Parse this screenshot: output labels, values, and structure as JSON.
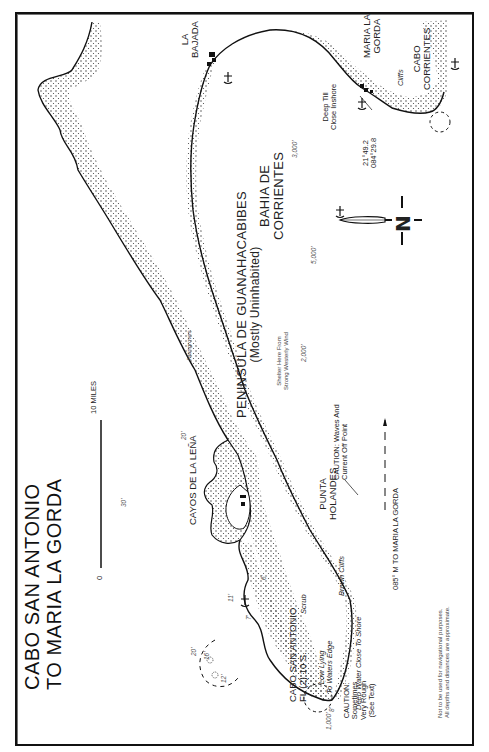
{
  "map": {
    "title_line1": "CABO SAN ANTONIO",
    "title_line2": "TO MARIA LA GORDA",
    "scale": {
      "start": "0",
      "end": "10 MILES"
    },
    "regions": {
      "peninsula_name": "PENINSULA DE GUANAHACABIBES",
      "peninsula_note": "(Mostly Uninhabited)",
      "bay_line1": "BAHIA DE",
      "bay_line2": "CORRIENTES",
      "cays": "CAYOS DE LA LEÑA"
    },
    "places": {
      "la_bajada_1": "LA",
      "la_bajada_2": "BAJADA",
      "maria_la_gorda_1": "MARIA LA",
      "maria_la_gorda_2": "GORDA",
      "cabo_corrientes_1": "CABO",
      "cabo_corrientes_2": "CORRIENTES",
      "punta_holandes_1": "PUNTA",
      "punta_holandes_2": "HOLANDES",
      "cabo_san_antonio": "CABO SAN ANTONIO",
      "light": "FL (2) 10 S."
    },
    "notes": {
      "cliffs": "Cliffs",
      "deep_till_1": "Deep Till",
      "deep_till_2": "Close Inshore",
      "position_lat": "21°49.2",
      "position_lon": "084°29.8",
      "mangroves": "Mangroves",
      "shelter_1": "Shelter Here From",
      "shelter_2": "Strong Westerly Wind",
      "caution_point_1": "CAUTION: Waves And",
      "caution_point_2": "Current Off Point",
      "course": "085° M TO MARIA LA GORDA",
      "scrub": "Scrub",
      "brown_cliffs": "Brown Cliffs",
      "low_lying_1": "Low Lying",
      "low_lying_2": "To Waters Edge",
      "deep_water": "Deep Water Close To Shore",
      "caution_rough_1": "CAUTION:",
      "caution_rough_2": "Sometimes",
      "caution_rough_3": "Very Rough",
      "caution_rough_4": "(See Text)",
      "disclaimer_1": "Not to be used for navigational purposes.",
      "disclaimer_2": "All depths and distances are approximate."
    },
    "depths": {
      "d3000": "3,000'",
      "d5000": "5,000'",
      "d2000": "2,000'",
      "d1000": "1,000'",
      "d20a": "20'",
      "d30": "30'",
      "d20b": "20'",
      "d16": "16'",
      "d12": "12'",
      "d11": "11'",
      "d7": "7'",
      "d6": "6'",
      "d8": "8'"
    },
    "compass": {
      "label": "N"
    }
  }
}
